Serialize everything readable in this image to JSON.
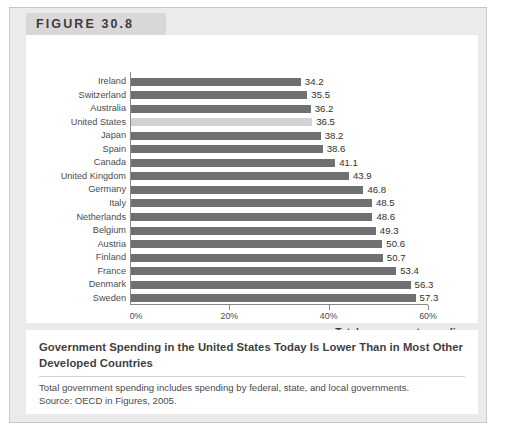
{
  "figure": {
    "label": "FIGURE 30.8"
  },
  "caption": {
    "title": "Government Spending in the United States Today Is Lower Than in Most Other Developed Countries",
    "note": "Total government spending includes spending by federal, state, and local governments.",
    "source": "Source: OECD in Figures, 2005."
  },
  "chart_data": {
    "type": "bar",
    "orientation": "horizontal",
    "title": "Government Spending in the United States Today Is Lower Than in Most Other Developed Countries",
    "xlabel": "Total government spending as a percentage of GDP",
    "ylabel": "",
    "xlim": [
      0,
      60
    ],
    "grid": false,
    "legend": false,
    "xtick_labels": [
      "0%",
      "20%",
      "40%",
      "60%"
    ],
    "xtick_values": [
      0,
      20,
      40,
      60
    ],
    "highlight_category": "United States",
    "colors": {
      "bar": "#6f7072",
      "bar_highlight": "#d2d2d2",
      "axis": "#8a8a8a",
      "value_text": "#303030",
      "label_text": "#4c4c4c"
    },
    "categories": [
      "Ireland",
      "Switzerland",
      "Australia",
      "United States",
      "Japan",
      "Spain",
      "Canada",
      "United Kingdom",
      "Germany",
      "Italy",
      "Netherlands",
      "Belgium",
      "Austria",
      "Finland",
      "France",
      "Denmark",
      "Sweden"
    ],
    "values": [
      34.2,
      35.5,
      36.2,
      36.5,
      38.2,
      38.6,
      41.1,
      43.9,
      46.8,
      48.5,
      48.6,
      49.3,
      50.6,
      50.7,
      53.4,
      56.3,
      57.3
    ],
    "value_labels": [
      "34.2",
      "35.5",
      "36.2",
      "36.5",
      "38.2",
      "38.6",
      "41.1",
      "43.9",
      "46.8",
      "48.5",
      "48.6",
      "49.3",
      "50.6",
      "50.7",
      "53.4",
      "56.3",
      "57.3"
    ]
  },
  "axis_title_lines": {
    "line1": "Total government spending",
    "line2": "as a percentage of GDP"
  }
}
